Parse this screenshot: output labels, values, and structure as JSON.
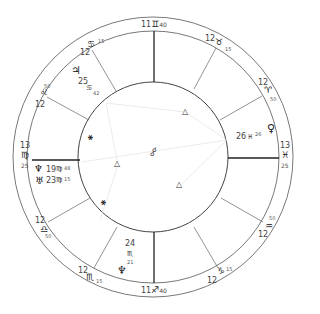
{
  "chart": {
    "type": "natal-wheel",
    "center": [
      153,
      157
    ],
    "outer_radius": 140,
    "ring_radius": 126,
    "inner_radius": 75
  },
  "angles": {
    "mc": {
      "deg": "11",
      "sign": "♊",
      "min": "40"
    },
    "ic": {
      "deg": "11",
      "sign": "♐",
      "min": "40"
    },
    "asc": {
      "deg": "13",
      "sign": "♍",
      "min": "25"
    },
    "dsc": {
      "deg": "13",
      "sign": "♓",
      "min": "25"
    }
  },
  "cusps": [
    {
      "id": "cusp-11",
      "deg": "12",
      "sign": "♋",
      "min": "15"
    },
    {
      "id": "cusp-12",
      "deg": "12",
      "sign": "♌",
      "min": "50"
    },
    {
      "id": "cusp-9",
      "deg": "12",
      "sign": "♉",
      "min": "15"
    },
    {
      "id": "cusp-8",
      "deg": "12",
      "sign": "♈",
      "min": "50"
    },
    {
      "id": "cusp-2",
      "deg": "12",
      "sign": "♎",
      "min": "50"
    },
    {
      "id": "cusp-3",
      "deg": "12",
      "sign": "♏",
      "min": "15"
    },
    {
      "id": "cusp-5",
      "deg": "12",
      "sign": "♑",
      "min": "15"
    },
    {
      "id": "cusp-6",
      "deg": "12",
      "sign": "♒",
      "min": "50"
    }
  ],
  "planets": [
    {
      "id": "jupiter",
      "glyph": "♃",
      "deg": "25",
      "sign": "♋",
      "min": "42",
      "flag": "ʀ"
    },
    {
      "id": "neptune",
      "glyph": "♆",
      "deg": "19",
      "sign": "♍",
      "min": "48",
      "flag": "ʀ"
    },
    {
      "id": "uranus",
      "glyph": "♅",
      "deg": "23",
      "sign": "♍",
      "min": "15",
      "flag": "ʀ"
    },
    {
      "id": "venus",
      "glyph": "♀",
      "deg": "26",
      "sign": "♓",
      "min": "26"
    },
    {
      "id": "pluto",
      "glyph": "♆",
      "deg": "24",
      "sign": "♏",
      "min": "21"
    }
  ],
  "aspect_glyphs": {
    "trine": "△",
    "quincunx": "⚹",
    "conjunction": "☌"
  }
}
